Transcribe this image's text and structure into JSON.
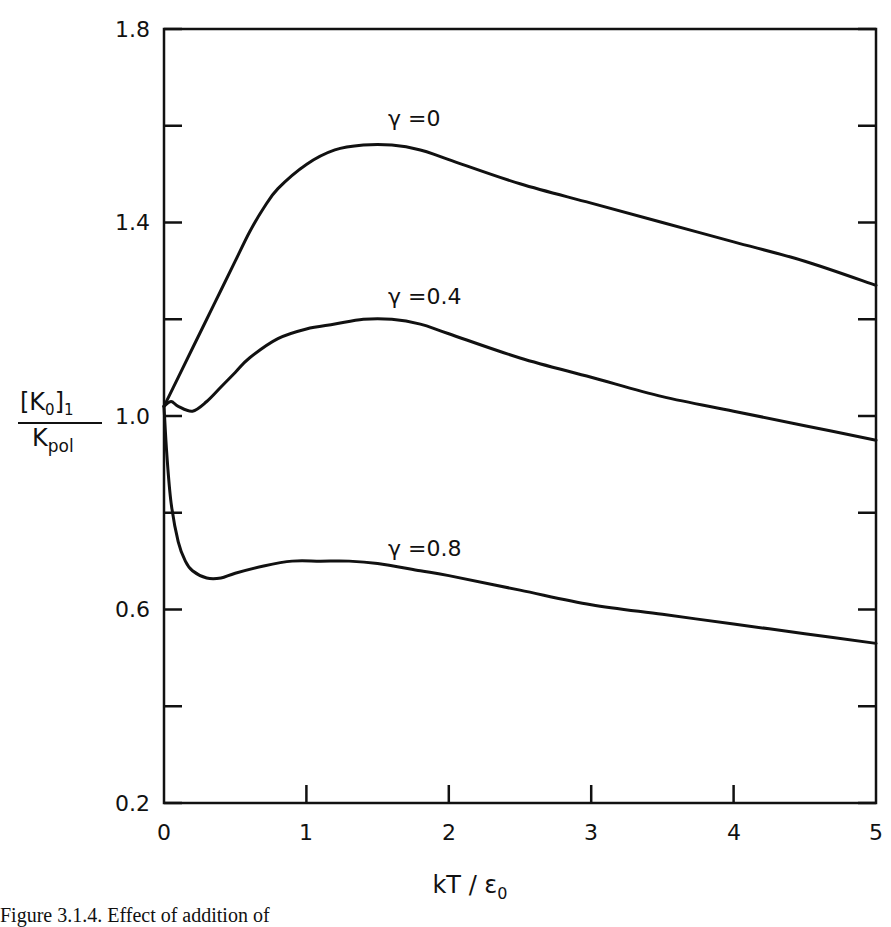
{
  "chart_data": {
    "type": "line",
    "title": "",
    "xlabel": "kT / ε0",
    "ylabel": "[K0]1 / Kpol",
    "xlim": [
      0,
      5
    ],
    "ylim": [
      0.2,
      1.8
    ],
    "grid": false,
    "legend_position": "inline labels on curves",
    "x_ticks": [
      0,
      1,
      2,
      3,
      4,
      5
    ],
    "x_tick_labels": [
      "0",
      "1",
      "2",
      "3",
      "4",
      "5"
    ],
    "y_ticks": [
      0.2,
      0.4,
      0.6,
      0.8,
      1.0,
      1.2,
      1.4,
      1.6,
      1.8
    ],
    "y_tick_labels": [
      "0.2",
      "",
      "0.6",
      "",
      "1.0",
      "",
      "1.4",
      "",
      "1.8"
    ],
    "series": [
      {
        "name": "γ=0",
        "x": [
          0,
          0.1,
          0.2,
          0.3,
          0.4,
          0.5,
          0.6,
          0.7,
          0.8,
          1.0,
          1.2,
          1.4,
          1.6,
          1.8,
          2.0,
          2.5,
          3.0,
          3.5,
          4.0,
          4.5,
          5.0
        ],
        "values": [
          1.02,
          1.08,
          1.14,
          1.2,
          1.26,
          1.32,
          1.38,
          1.43,
          1.47,
          1.52,
          1.55,
          1.56,
          1.56,
          1.55,
          1.53,
          1.48,
          1.44,
          1.4,
          1.36,
          1.32,
          1.27
        ]
      },
      {
        "name": "γ=0.4",
        "x": [
          0,
          0.05,
          0.1,
          0.2,
          0.3,
          0.4,
          0.5,
          0.6,
          0.8,
          1.0,
          1.2,
          1.4,
          1.6,
          1.8,
          2.0,
          2.5,
          3.0,
          3.5,
          4.0,
          4.5,
          5.0
        ],
        "values": [
          1.02,
          1.03,
          1.02,
          1.01,
          1.03,
          1.06,
          1.09,
          1.12,
          1.16,
          1.18,
          1.19,
          1.2,
          1.2,
          1.19,
          1.17,
          1.12,
          1.08,
          1.04,
          1.01,
          0.98,
          0.95
        ]
      },
      {
        "name": "γ=0.8",
        "x": [
          0,
          0.02,
          0.05,
          0.1,
          0.15,
          0.2,
          0.3,
          0.4,
          0.5,
          0.7,
          0.9,
          1.1,
          1.3,
          1.5,
          1.8,
          2.0,
          2.5,
          3.0,
          3.5,
          4.0,
          4.5,
          5.0
        ],
        "values": [
          1.02,
          0.92,
          0.82,
          0.74,
          0.7,
          0.68,
          0.665,
          0.665,
          0.675,
          0.69,
          0.7,
          0.7,
          0.7,
          0.695,
          0.68,
          0.67,
          0.64,
          0.61,
          0.59,
          0.57,
          0.55,
          0.53
        ]
      }
    ],
    "annotations": [
      {
        "text": "γ=0",
        "x": 1.55,
        "y": 1.61
      },
      {
        "text": "γ=0.4",
        "x": 1.55,
        "y": 1.23
      },
      {
        "text": "γ=0.8",
        "x": 1.55,
        "y": 0.72
      }
    ]
  },
  "labels": {
    "y_numerator": "[K",
    "y_numerator_sub": "0",
    "y_numerator_close": "]",
    "y_numerator_sub2": "1",
    "y_denominator": "K",
    "y_denominator_sub": "pol",
    "x_main": "kT / ε",
    "x_sub": "0",
    "curve_0": "γ =0",
    "curve_1": "γ =0.4",
    "curve_2": "γ =0.8",
    "tick_x_0": "0",
    "tick_x_1": "1",
    "tick_x_2": "2",
    "tick_x_3": "3",
    "tick_x_4": "4",
    "tick_x_5": "5",
    "tick_y_02": "0.2",
    "tick_y_06": "0.6",
    "tick_y_10": "1.0",
    "tick_y_14": "1.4",
    "tick_y_18": "1.8"
  },
  "caption": "Figure 3.1.4. Effect of addition of"
}
